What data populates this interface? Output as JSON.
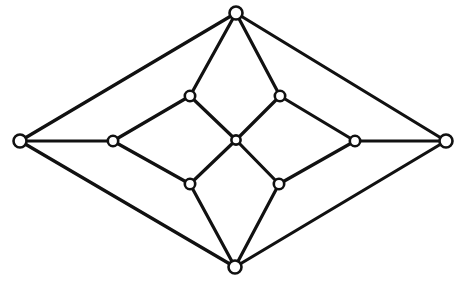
{
  "figure": {
    "name": "planar-graph-diagram",
    "background_color": "#ffffff",
    "canvas": {
      "width": 465,
      "height": 281
    }
  },
  "style": {
    "edge_color": "#111111",
    "edge_width": 3.2,
    "vertex_stroke_color": "#111111",
    "vertex_fill_color": "#ffffff",
    "vertex_stroke_width": 2.6,
    "vertex_radius_outer": 6.5,
    "vertex_radius_inner": 5.2,
    "vertex_radius_center": 4.6
  },
  "graph_data": {
    "type": "graph",
    "directed": false,
    "vertex_count": 11,
    "edge_count": 20,
    "vertices": [
      {
        "id": "top",
        "label": "top apex",
        "x": 236,
        "y": 13,
        "size": "outer",
        "degree": 4
      },
      {
        "id": "bottom",
        "label": "bottom apex",
        "x": 235,
        "y": 267,
        "size": "outer",
        "degree": 4
      },
      {
        "id": "left",
        "label": "left apex",
        "x": 20,
        "y": 141,
        "size": "outer",
        "degree": 3
      },
      {
        "id": "right",
        "label": "right apex",
        "x": 446,
        "y": 141,
        "size": "outer",
        "degree": 3
      },
      {
        "id": "leftmid",
        "label": "left middle",
        "x": 113,
        "y": 141,
        "size": "inner",
        "degree": 3
      },
      {
        "id": "rightmid",
        "label": "right middle",
        "x": 355,
        "y": 141,
        "size": "inner",
        "degree": 3
      },
      {
        "id": "ul",
        "label": "upper left inner",
        "x": 190,
        "y": 96,
        "size": "inner",
        "degree": 3
      },
      {
        "id": "ur",
        "label": "upper right inner",
        "x": 280,
        "y": 96,
        "size": "inner",
        "degree": 3
      },
      {
        "id": "ll",
        "label": "lower left inner",
        "x": 190,
        "y": 184,
        "size": "inner",
        "degree": 3
      },
      {
        "id": "lr",
        "label": "lower right inner",
        "x": 279,
        "y": 184,
        "size": "inner",
        "degree": 3
      },
      {
        "id": "center",
        "label": "center hub",
        "x": 236,
        "y": 140,
        "size": "center",
        "degree": 4
      }
    ],
    "edges": [
      {
        "from": "left",
        "to": "top",
        "role": "outer-boundary"
      },
      {
        "from": "top",
        "to": "right",
        "role": "outer-boundary"
      },
      {
        "from": "right",
        "to": "bottom",
        "role": "outer-boundary"
      },
      {
        "from": "bottom",
        "to": "left",
        "role": "outer-boundary"
      },
      {
        "from": "left",
        "to": "leftmid",
        "role": "horizontal-spoke"
      },
      {
        "from": "right",
        "to": "rightmid",
        "role": "horizontal-spoke"
      },
      {
        "from": "top",
        "to": "ul",
        "role": "inner-link"
      },
      {
        "from": "top",
        "to": "ur",
        "role": "inner-link"
      },
      {
        "from": "bottom",
        "to": "ll",
        "role": "inner-link"
      },
      {
        "from": "bottom",
        "to": "lr",
        "role": "inner-link"
      },
      {
        "from": "leftmid",
        "to": "ul",
        "role": "inner-rhombus"
      },
      {
        "from": "leftmid",
        "to": "ll",
        "role": "inner-rhombus"
      },
      {
        "from": "rightmid",
        "to": "ur",
        "role": "inner-rhombus"
      },
      {
        "from": "rightmid",
        "to": "lr",
        "role": "inner-rhombus"
      },
      {
        "from": "ul",
        "to": "center",
        "role": "hub-spoke"
      },
      {
        "from": "ur",
        "to": "center",
        "role": "hub-spoke"
      },
      {
        "from": "ll",
        "to": "center",
        "role": "hub-spoke"
      },
      {
        "from": "lr",
        "to": "center",
        "role": "hub-spoke"
      }
    ]
  }
}
